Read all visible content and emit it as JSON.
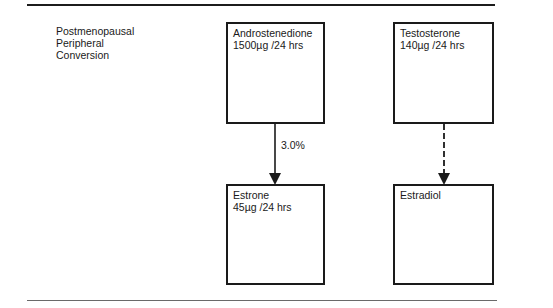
{
  "diagram": {
    "side_label": "Postmenopausal\nPeripheral\nConversion",
    "nodes": [
      {
        "id": "androstenedione",
        "name": "Androstenedione",
        "amount": "1500µg /24 hrs"
      },
      {
        "id": "testosterone",
        "name": "Testosterone",
        "amount": "140µg /24 hrs"
      },
      {
        "id": "estrone",
        "name": "Estrone",
        "amount": "45µg /24 hrs"
      },
      {
        "id": "estradiol",
        "name": "Estradiol",
        "amount": ""
      }
    ],
    "edges": [
      {
        "from": "androstenedione",
        "to": "estrone",
        "style": "solid",
        "label": "3.0%"
      },
      {
        "from": "testosterone",
        "to": "estradiol",
        "style": "dashed",
        "label": ""
      }
    ],
    "colors": {
      "line": "#1a1a1a",
      "rule_bottom": "#6a6a6a"
    }
  }
}
